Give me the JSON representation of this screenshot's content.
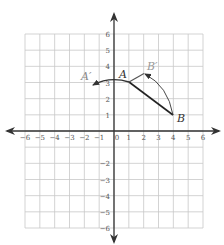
{
  "diagram": {
    "type": "coordinate-plane-rotation",
    "grid": {
      "x_range": [
        -6,
        6
      ],
      "y_range": [
        -6,
        6
      ],
      "px_left": 25,
      "px_right": 203,
      "px_top": 34,
      "px_bottom": 228,
      "origin_px": [
        114,
        131
      ],
      "grid_color": "#c8c8c8",
      "axis_color": "#333333"
    },
    "x_tick_labels": [
      "−6",
      "−5",
      "−4",
      "−3",
      "−2",
      "−1",
      "0",
      "1",
      "2",
      "3",
      "4",
      "5",
      "6"
    ],
    "y_tick_labels_positive": [
      "1",
      "2",
      "3",
      "4",
      "5",
      "6"
    ],
    "y_tick_labels_negative": [
      "−2",
      "−3",
      "−4",
      "−5",
      "−6"
    ],
    "points": {
      "A": {
        "label": "A",
        "coord": [
          1,
          3
        ],
        "color": "#222222"
      },
      "B": {
        "label": "B",
        "coord": [
          4,
          1
        ],
        "color": "#222222"
      },
      "A_prime": {
        "label": "A′",
        "coord": [
          -1.4,
          2.85
        ],
        "color": "#888888"
      },
      "B_prime": {
        "label": "B′",
        "coord": [
          2,
          3.6
        ],
        "color": "#888888"
      }
    },
    "segments": [
      {
        "name": "AB",
        "from": "A",
        "to": "B",
        "color": "#222222"
      },
      {
        "name": "AB_prime",
        "from": "A",
        "to": "B_prime",
        "color": "#666666"
      }
    ],
    "arcs": [
      {
        "name": "arc-A-to-A-prime",
        "from": "A",
        "to": "A_prime"
      },
      {
        "name": "arc-B-to-B-prime",
        "from": "B",
        "to": "B_prime"
      }
    ]
  }
}
